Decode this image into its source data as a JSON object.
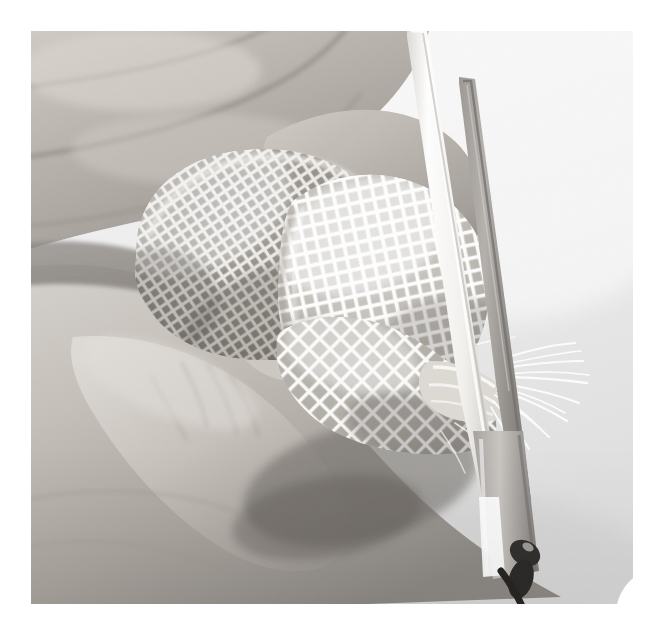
{
  "figure": {
    "kind": "instructional-photograph",
    "step_number": "8",
    "caption": ""
  },
  "canvas": {
    "width": 662,
    "height": 633,
    "page_background": "#ffffff"
  },
  "photo": {
    "x": 31,
    "y": 31,
    "width": 602,
    "height": 573,
    "palette": {
      "backdrop_light": "#f3f3f3",
      "backdrop_mid": "#e4e4e4",
      "backdrop_shadow": "#cfcfcf",
      "skin_light": "#d6d2cd",
      "skin_mid": "#bdb8b2",
      "skin_dark": "#8f8a85",
      "skin_deep_shadow": "#5d5955",
      "gauze_highlight": "#f7f6f4",
      "gauze_mid": "#ddd9d4",
      "gauze_shadow": "#9d9892",
      "blade_bright": "#fbfbfa",
      "blade_mid": "#cdcac6",
      "blade_dark": "#8d8a87",
      "blade_edge": "#6e6b68",
      "pivot_dark": "#2e2c2a"
    }
  },
  "badge": {
    "x": 585,
    "y": 537,
    "width": 48,
    "height": 67,
    "background": "#ffffff",
    "text_color": "#3b3b3b",
    "corner_radius": 46,
    "label": "8"
  }
}
